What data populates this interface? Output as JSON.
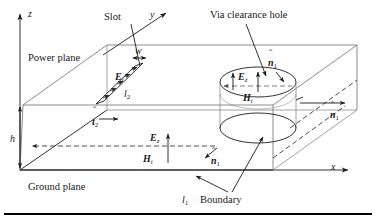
{
  "figure": {
    "background_color": "#ffffff",
    "line_color": "#1a1a1a",
    "faint_line_color": "#6f6f6f"
  },
  "axes": {
    "z_label": "z",
    "y_label": "y",
    "x_label": "x"
  },
  "labels": {
    "power_plane": "Power plane",
    "ground_plane": "Ground plane",
    "slot": "Slot",
    "via_clearance_hole": "Via clearance hole",
    "boundary": "Boundary",
    "height": "h",
    "slot_width": "w",
    "slot_length": "l",
    "slot_length_sub": "2",
    "boundary_length": "l",
    "boundary_length_sub": "1"
  },
  "fields": {
    "Et_symbol": "E",
    "Et_sub": "t",
    "Ez_symbol": "E",
    "Ez_sub": "z",
    "Ht_symbol": "H",
    "Ht_sub": "t",
    "n_hat_symbol": "n",
    "n_hat_sub": "1",
    "t_hat_symbol": "t",
    "t_hat_sub": "2"
  },
  "annotations": [
    {
      "name": "slot-Et",
      "text": "E_t",
      "desc": "tangential electric field across slot"
    },
    {
      "name": "slot-width-w",
      "text": "w",
      "desc": "slot width double arrow"
    },
    {
      "name": "slot-length-l2",
      "text": "l_2",
      "desc": "slot length"
    },
    {
      "name": "slot-t2-hat",
      "text": "t_2",
      "desc": "unit tangent vector of slot contour"
    },
    {
      "name": "hole-Ez",
      "text": "E_z",
      "desc": "vertical electric field in via hole"
    },
    {
      "name": "hole-Ht",
      "text": "H_t",
      "desc": "tangential magnetic field in via hole"
    },
    {
      "name": "hole-n1-hat",
      "text": "n_1",
      "desc": "outward normal at via hole"
    },
    {
      "name": "cavity-Ez",
      "text": "E_z",
      "desc": "vertical electric field in cavity"
    },
    {
      "name": "cavity-Ht",
      "text": "H_t",
      "desc": "tangential magnetic field in cavity"
    },
    {
      "name": "cavity-n1-hat",
      "text": "n_1",
      "desc": "outward normal at cavity interior"
    },
    {
      "name": "edge-n1-hat",
      "text": "n_1",
      "desc": "outward normal at boundary edge"
    },
    {
      "name": "boundary-l1",
      "text": "l_1",
      "desc": "boundary contour length"
    }
  ],
  "geometry": {
    "cavity_height_label": "h",
    "top_plate": "power plane",
    "bottom_plate": "ground plane"
  }
}
